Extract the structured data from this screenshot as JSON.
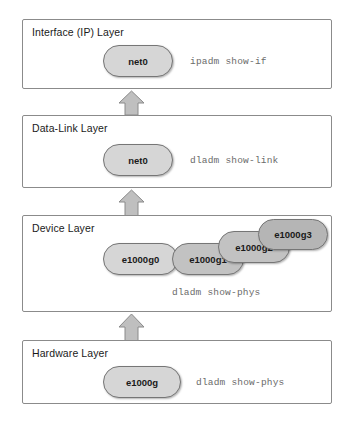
{
  "diagram": {
    "colors": {
      "box_border": "#8b8b8b",
      "pill_light": "#d6d6d6",
      "pill_medium": "#c2c2c2",
      "pill_dark": "#b5b5b5",
      "pill_border": "#767676",
      "arrow_fill": "#bfbfbf",
      "arrow_stroke": "#8a8a8a",
      "command_text": "#6b6b6b",
      "title_text": "#1a1a1a"
    },
    "layers": [
      {
        "id": "interface",
        "title": "Interface (IP) Layer",
        "command": "ipadm show-if",
        "nodes": [
          {
            "label": "net0",
            "shade": "light"
          }
        ]
      },
      {
        "id": "data-link",
        "title": "Data-Link Layer",
        "command": "dladm show-link",
        "nodes": [
          {
            "label": "net0",
            "shade": "light"
          }
        ]
      },
      {
        "id": "device",
        "title": "Device Layer",
        "command": "dladm show-phys",
        "nodes": [
          {
            "label": "e1000g0",
            "shade": "light"
          },
          {
            "label": "e1000g1",
            "shade": "medium"
          },
          {
            "label": "e1000g2",
            "shade": "medium"
          },
          {
            "label": "e1000g3",
            "shade": "dark"
          }
        ]
      },
      {
        "id": "hardware",
        "title": "Hardware Layer",
        "command": "dladm show-phys",
        "nodes": [
          {
            "label": "e1000g",
            "shade": "light"
          }
        ]
      }
    ],
    "arrows": [
      {
        "id": "device-to-datalink",
        "direction": "up"
      },
      {
        "id": "datalink-to-interface",
        "direction": "up"
      },
      {
        "id": "hardware-to-device",
        "direction": "up"
      }
    ]
  }
}
